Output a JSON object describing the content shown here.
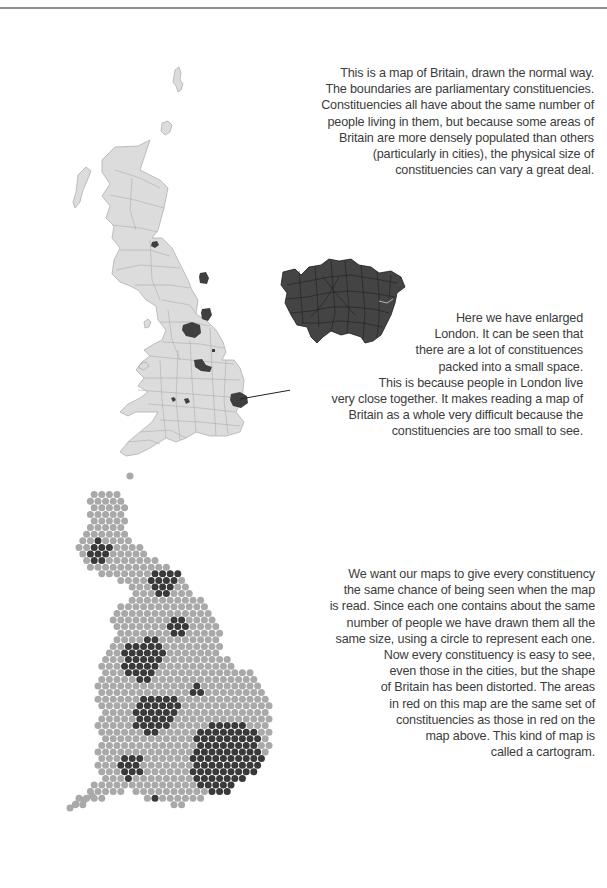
{
  "page": {
    "paragraphs": {
      "normal_map": [
        "This is a map of Britain, drawn the normal way.",
        "The boundaries are parliamentary constituencies.",
        "Constituencies all have about the same number of",
        "people living in them, but because some areas of",
        "Britain are more densely populated than others",
        "(particularly in cities), the physical size of",
        "constituencies can vary a great deal."
      ],
      "london": [
        "Here we have enlarged",
        "London.  It can be seen that",
        "there are a lot of constituences",
        "packed into a small space.",
        "This is because people in London live",
        "very close together. It makes reading a map of",
        "Britain as a whole very difficult because the",
        "constituencies are too small to see."
      ],
      "cartogram": [
        "We want our maps to give every constituency",
        "the same chance of being seen when the map",
        "is read.  Since each one contains about the same",
        "number of people we have drawn them all the",
        "same size, using a circle to represent each one.",
        "Now every constituency is easy to see,",
        "even those in the cities, but the shape",
        "of Britain has been distorted.  The areas",
        "in red on this map are the same set of",
        "constituencies as those in red on the",
        "map above.  This kind of map is",
        "called a cartogram."
      ]
    },
    "colors": {
      "land": "#dcdcdc",
      "highlight": "#3f3f3f",
      "dot_normal": "#a9a9a9",
      "dot_highlight": "#393939",
      "rule": "#8e8e8e"
    },
    "maps": {
      "normal_map_label": "Map of Britain with parliamentary constituency boundaries",
      "london_inset_label": "Enlarged London constituencies",
      "cartogram_label": "Constituency cartogram, one equal-size circle per constituency"
    }
  }
}
